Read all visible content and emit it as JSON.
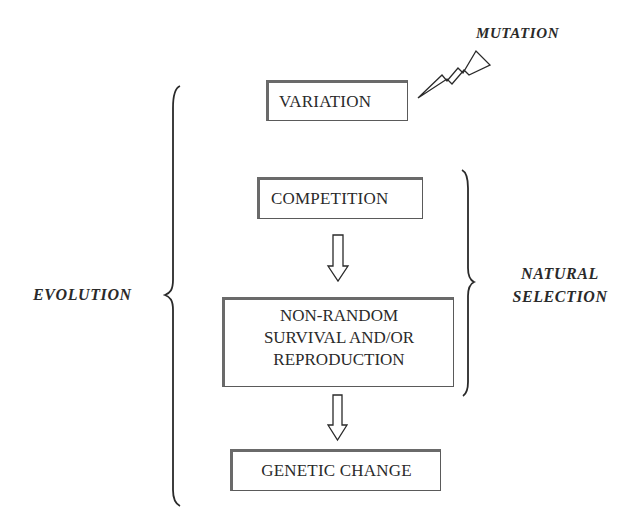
{
  "diagram": {
    "labels": {
      "mutation": "MUTATION",
      "evolution": "EVOLUTION",
      "natural_selection_line1": "NATURAL",
      "natural_selection_line2": "SELECTION"
    },
    "boxes": {
      "variation": "VARIATION",
      "competition": "COMPETITION",
      "survival_line1": "NON-RANDOM",
      "survival_line2": "SURVIVAL AND/OR",
      "survival_line3": "REPRODUCTION",
      "genetic_change": "GENETIC CHANGE"
    },
    "icons": {
      "mutation": "lightning-bolt-icon",
      "arrow1": "down-arrow-icon",
      "arrow2": "down-arrow-icon",
      "evolution_brace": "left-curly-brace",
      "selection_brace": "right-curly-brace"
    },
    "colors": {
      "stroke": "#2a2a2a",
      "box_border": "#5a5a5a",
      "background": "#ffffff"
    }
  }
}
